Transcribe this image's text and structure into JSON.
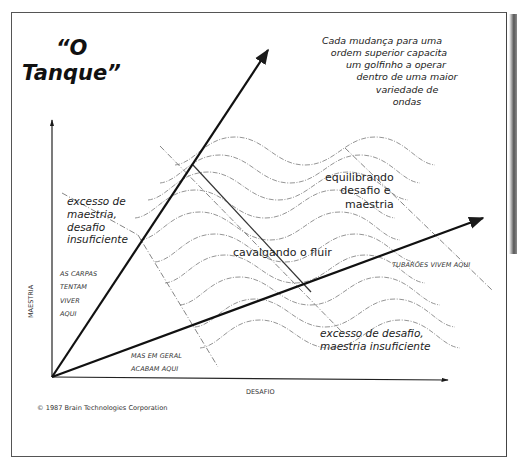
{
  "title": {
    "line1": "“O",
    "line2": "Tanque”"
  },
  "note": {
    "lines": [
      "Cada mudança para uma",
      "ordem superior capacita",
      "um golfinho a operar",
      "dentro de uma maior",
      "variedade de",
      "ondas"
    ]
  },
  "zones": {
    "balance": [
      "equilibrando",
      "desafio e",
      "maestria"
    ],
    "flow": "cavalgando o fluir",
    "too_much_mastery": [
      "excesso de",
      "maestria,",
      "desafio",
      "insuficiente"
    ],
    "too_much_challenge": [
      "excesso de desafio,",
      "maestria insuficiente"
    ],
    "carps_try": [
      "AS CARPAS",
      "TENTAM",
      "VIVER",
      "AQUI"
    ],
    "but_end_up": [
      "MAS EM GERAL",
      "ACABAM AQUI"
    ],
    "sharks": "TUBARÕES VIVEM AQUI"
  },
  "axes": {
    "y_label": "MAESTRIA",
    "x_label": "DESAFIO"
  },
  "credit": "© 1987 Brain Technologies Corporation",
  "colors": {
    "ink": "#1a1a1a",
    "wave": "#777777",
    "frame": "#555555",
    "paper": "#ffffff"
  }
}
